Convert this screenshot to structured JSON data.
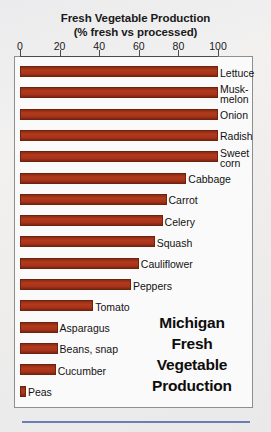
{
  "chart_data": {
    "type": "bar",
    "orientation": "horizontal",
    "title": "Fresh Vegetable Production",
    "subtitle": "(% fresh vs processed)",
    "xlabel": "",
    "ylabel": "",
    "xlim": [
      0,
      100
    ],
    "xticks": [
      0,
      20,
      40,
      60,
      80,
      100
    ],
    "xtick_labels": [
      "0",
      "20",
      "40",
      "60",
      "80",
      "100"
    ],
    "grid": false,
    "legend": "none",
    "bar_color": "#a8331a",
    "categories": [
      "Lettuce",
      "Muskmelon",
      "Onion",
      "Radish",
      "Sweet corn",
      "Cabbage",
      "Carrot",
      "Celery",
      "Squash",
      "Cauliflower",
      "Peppers",
      "Tomato",
      "Asparagus",
      "Beans, snap",
      "Cucumber",
      "Peas"
    ],
    "values": [
      100,
      100,
      100,
      100,
      100,
      84,
      74,
      72,
      68,
      60,
      56,
      37,
      19,
      19,
      18,
      3
    ],
    "annotation": "Michigan Fresh Vegetable Production"
  },
  "chart": {
    "title_lines": [
      "Fresh Vegetable Production",
      "(% fresh vs processed)"
    ],
    "axis": {
      "ticks": [
        {
          "label": "0",
          "value": 0
        },
        {
          "label": "20",
          "value": 20
        },
        {
          "label": "40",
          "value": 40
        },
        {
          "label": "60",
          "value": 60
        },
        {
          "label": "80",
          "value": 80
        },
        {
          "label": "100",
          "value": 100
        }
      ]
    },
    "bars": [
      {
        "label_line1": "Lettuce",
        "label_line2": "",
        "value": 100
      },
      {
        "label_line1": "Musk-",
        "label_line2": "melon",
        "value": 100
      },
      {
        "label_line1": "Onion",
        "label_line2": "",
        "value": 100
      },
      {
        "label_line1": "Radish",
        "label_line2": "",
        "value": 100
      },
      {
        "label_line1": "Sweet",
        "label_line2": "corn",
        "value": 100
      },
      {
        "label_line1": "Cabbage",
        "label_line2": "",
        "value": 84
      },
      {
        "label_line1": "Carrot",
        "label_line2": "",
        "value": 74
      },
      {
        "label_line1": "Celery",
        "label_line2": "",
        "value": 72
      },
      {
        "label_line1": "Squash",
        "label_line2": "",
        "value": 68
      },
      {
        "label_line1": "Cauliflower",
        "label_line2": "",
        "value": 60
      },
      {
        "label_line1": "Peppers",
        "label_line2": "",
        "value": 56
      },
      {
        "label_line1": "Tomato",
        "label_line2": "",
        "value": 37
      },
      {
        "label_line1": "Asparagus",
        "label_line2": "",
        "value": 19
      },
      {
        "label_line1": "Beans, snap",
        "label_line2": "",
        "value": 19
      },
      {
        "label_line1": "Cucumber",
        "label_line2": "",
        "value": 18
      },
      {
        "label_line1": "Peas",
        "label_line2": "",
        "value": 3
      }
    ],
    "annotation_lines": [
      "Michigan",
      "Fresh",
      "Vegetable",
      "Production"
    ]
  },
  "colors": {
    "bar": "#a8331a",
    "rule": "#6d7cb5",
    "frame": "#8e8e92",
    "text": "#121212"
  }
}
